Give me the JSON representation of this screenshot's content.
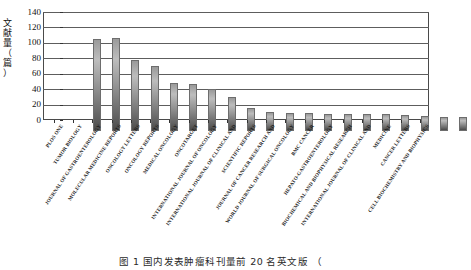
{
  "figure": {
    "caption": "图 1  国内učby来源文献数量前 20 名英文期刊",
    "caption_visible": "图 1  国内发表肿瘤科刊量前 20 名英文版  （",
    "y_axis_title_chars": [
      "文",
      "献",
      "量",
      "（",
      "篇",
      "）"
    ]
  },
  "chart_data": {
    "type": "bar",
    "title": "",
    "xlabel": "",
    "ylabel": "文献量（篇）",
    "ylim": [
      0,
      140
    ],
    "yticks": [
      0,
      20,
      40,
      60,
      80,
      100,
      120,
      140
    ],
    "ytick_labels": [
      "0",
      "20",
      "40",
      "60",
      "80",
      "100",
      "120",
      "140"
    ],
    "grid": true,
    "grid_axis": "y",
    "legend": false,
    "bar_color": "#8e8e8e",
    "categories": [
      "PLOS ONE",
      "TUMOR BIOLOGY",
      "JOURNAL OF GASTROENTEROLOGY",
      "MOLECULAR MEDICINE REPORTS",
      "ONCOLOGY LETTERS",
      "ONCOLOGY REPORTS",
      "MEDICAL ONCOLOGY",
      "ONCOTARGET",
      "INTERNATIONAL JOURNAL OF ONCOLOGY",
      "INTERNATIONAL JOURNAL OF CLINICAL AND",
      "SCIENTIFIC REPORTS",
      "JOURNAL OF CANCER RESEARCH AND",
      "WORLD JOURNAL OF SURGICAL ONCOLOGY",
      "BMC CANCER",
      "HEPATO-GASTROENTEROLOGY",
      "BIOCHEMICAL AND BIOPHYSICAL RESEARCH",
      "INTERNATIONAL JOURNAL OF CLINICAL AND",
      "MEDICINE",
      "CANCER LETTERS",
      "CELL BIOCHEMISTRY AND BIOPHYSICS"
    ],
    "values": [
      122,
      123,
      94,
      86,
      63,
      62,
      56,
      45,
      30,
      25,
      24,
      24,
      23,
      23,
      22,
      22,
      21,
      20,
      19,
      18
    ]
  }
}
